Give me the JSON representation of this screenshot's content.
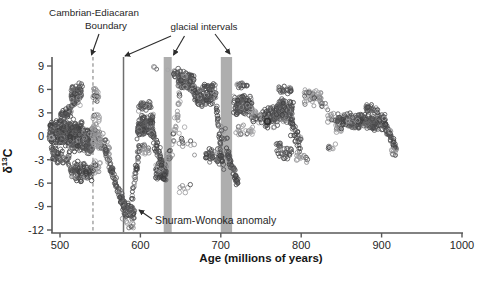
{
  "figure": {
    "background": "#ffffff"
  },
  "annotations": {
    "cambrian_ediacaran_line1": "Cambrian-Ediacaran",
    "cambrian_ediacaran_line2": "Boundary",
    "glacial_intervals": "glacial intervals",
    "shuram_wonoka": "Shuram-Wonoka anomaly"
  },
  "axes": {
    "x_label": "Age (millions of years)",
    "y_label": {
      "delta": "δ",
      "sup": "13",
      "c": "C"
    }
  },
  "colors": {
    "axis": "#585858",
    "tick_text": "#262626",
    "dashed_boundary_line": "#8f8f8f",
    "glacial_line": "#6e6e6e",
    "glacial_bar": "#aeaeae",
    "arrow": "#2d2d2d",
    "point_dark": [
      "#3e3e40",
      "#4a4a4c",
      "#565658",
      "#646466"
    ],
    "point_light": [
      "#8d8d8f",
      "#9b9b9d",
      "#a7a7a9"
    ]
  },
  "chart_data": {
    "type": "scatter",
    "title": "",
    "xlabel": "Age (millions of years)",
    "ylabel": "δ13C",
    "x_axis": {
      "min": 500,
      "max": 1000,
      "ticks": [
        500,
        600,
        700,
        800,
        900,
        1000
      ],
      "grid": false
    },
    "y_axis": {
      "min": -12,
      "max": 9.9,
      "ticks": [
        9,
        6,
        3,
        0,
        -3,
        -6,
        -9,
        -12
      ],
      "grid": false
    },
    "reference_marks": {
      "cambrian_ediacaran_boundary_age": 541,
      "gaskiers_glacial_line_age": 579,
      "glacial_bars_age_ranges": [
        [
          629,
          639
        ],
        [
          700,
          714
        ]
      ]
    },
    "bold_point": {
      "age": 758,
      "d13c": 1.9
    },
    "envelope_segments_legend": [
      "age_start",
      "age_end",
      "n_points",
      "d13c_start",
      "d13c_end",
      "spread",
      "shade d=dark l=light"
    ],
    "envelope_segments": [
      [
        487,
        512,
        220,
        0.5,
        0.3,
        1.8,
        "d"
      ],
      [
        489,
        512,
        55,
        -2.3,
        -2.8,
        1.2,
        "d"
      ],
      [
        500,
        514,
        40,
        2.3,
        3.2,
        1.0,
        "d"
      ],
      [
        512,
        528,
        180,
        0.2,
        0.0,
        2.2,
        "d"
      ],
      [
        514,
        527,
        85,
        5.0,
        5.5,
        1.6,
        "d"
      ],
      [
        513,
        528,
        65,
        -4.2,
        -4.6,
        1.4,
        "d"
      ],
      [
        528,
        540,
        150,
        -0.5,
        -0.8,
        1.8,
        "d"
      ],
      [
        529,
        540,
        45,
        -4.3,
        -4.8,
        1.0,
        "d"
      ],
      [
        540,
        549,
        55,
        0.5,
        0.5,
        2.6,
        "l"
      ],
      [
        540,
        548,
        20,
        5.5,
        5.2,
        1.1,
        "l"
      ],
      [
        541,
        550,
        16,
        -3.8,
        -4.2,
        1.0,
        "l"
      ],
      [
        548,
        562,
        40,
        0.0,
        -2.0,
        1.6,
        "l"
      ],
      [
        556,
        581,
        85,
        -2.0,
        -9.2,
        0.9,
        "d"
      ],
      [
        577,
        593,
        50,
        -9.4,
        -9.7,
        1.3,
        "d"
      ],
      [
        583,
        592,
        9,
        -11.2,
        -11.5,
        0.5,
        "l"
      ],
      [
        587,
        599,
        42,
        -10.0,
        -1.2,
        0.8,
        "d"
      ],
      [
        596,
        616,
        130,
        1.0,
        1.8,
        1.5,
        "d"
      ],
      [
        598,
        614,
        28,
        3.8,
        4.0,
        0.8,
        "d"
      ],
      [
        599,
        612,
        18,
        -1.8,
        -1.5,
        0.8,
        "l"
      ],
      [
        616,
        622,
        3,
        8.9,
        8.6,
        0.3,
        "d"
      ],
      [
        613,
        632,
        65,
        1.0,
        -5.0,
        1.2,
        "d"
      ],
      [
        619,
        631,
        65,
        -4.3,
        -4.8,
        1.4,
        "d"
      ],
      [
        632,
        641,
        13,
        -2.5,
        -3.0,
        2.0,
        "l"
      ],
      [
        632,
        646,
        5,
        8.6,
        8.2,
        0.6,
        "l"
      ],
      [
        641,
        649,
        22,
        0.5,
        4.5,
        2.0,
        "l"
      ],
      [
        642,
        649,
        9,
        7.8,
        8.2,
        0.7,
        "d"
      ],
      [
        647,
        666,
        120,
        7.2,
        7.0,
        1.3,
        "d"
      ],
      [
        664,
        674,
        45,
        6.2,
        4.6,
        1.1,
        "d"
      ],
      [
        646,
        668,
        13,
        0.5,
        -1.5,
        1.6,
        "l"
      ],
      [
        648,
        662,
        7,
        -6.2,
        -6.8,
        1.3,
        "l"
      ],
      [
        674,
        694,
        100,
        5.0,
        5.4,
        1.3,
        "d"
      ],
      [
        678,
        692,
        15,
        6.4,
        6.4,
        0.5,
        "d"
      ],
      [
        681,
        702,
        45,
        -2.3,
        -2.7,
        1.2,
        "d"
      ],
      [
        694,
        703,
        35,
        3.5,
        -4.0,
        1.0,
        "d"
      ],
      [
        697,
        709,
        9,
        0.8,
        0.2,
        1.0,
        "l"
      ],
      [
        706,
        722,
        50,
        -1.5,
        -6.4,
        0.9,
        "d"
      ],
      [
        716,
        738,
        115,
        4.2,
        3.8,
        1.5,
        "d"
      ],
      [
        719,
        734,
        18,
        6.6,
        6.4,
        0.5,
        "d"
      ],
      [
        717,
        740,
        22,
        0.8,
        0.6,
        0.9,
        "l"
      ],
      [
        738,
        752,
        28,
        2.6,
        2.2,
        1.3,
        "l"
      ],
      [
        752,
        770,
        65,
        2.2,
        2.6,
        1.5,
        "d"
      ],
      [
        768,
        790,
        135,
        3.4,
        3.0,
        1.8,
        "d"
      ],
      [
        772,
        788,
        22,
        6.0,
        5.8,
        0.7,
        "d"
      ],
      [
        769,
        788,
        32,
        -1.5,
        -2.2,
        1.2,
        "d"
      ],
      [
        786,
        800,
        40,
        1.5,
        -1.0,
        1.3,
        "d"
      ],
      [
        794,
        807,
        14,
        -2.4,
        -3.2,
        0.8,
        "l"
      ],
      [
        804,
        826,
        50,
        5.1,
        4.7,
        1.5,
        "l"
      ],
      [
        826,
        850,
        32,
        4.0,
        0.5,
        1.2,
        "l"
      ],
      [
        830,
        846,
        8,
        -1.3,
        -1.6,
        0.7,
        "l"
      ],
      [
        845,
        905,
        230,
        2.0,
        1.8,
        1.1,
        "d"
      ],
      [
        880,
        896,
        28,
        3.6,
        3.4,
        0.6,
        "d"
      ],
      [
        902,
        918,
        55,
        2.2,
        -1.6,
        0.8,
        "d"
      ],
      [
        912,
        919,
        8,
        -1.8,
        -2.4,
        0.6,
        "l"
      ]
    ]
  }
}
